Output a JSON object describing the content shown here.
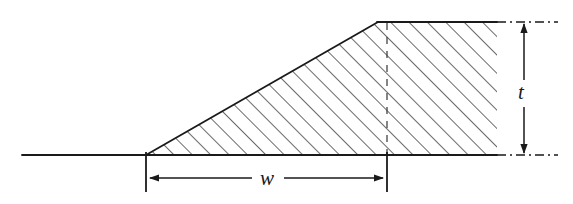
{
  "figure": {
    "type": "technical-line-drawing",
    "background_color": "#ffffff",
    "line_color": "#1a1a1a",
    "hatch_color": "#2b2b2b"
  },
  "labels": {
    "width_label": "w",
    "thickness_label": "t"
  },
  "geometry": {
    "ground_line": {
      "name": "ground-reference-line",
      "x1": 22,
      "y1": 155,
      "x2": 497,
      "y2": 155
    },
    "section_outline": {
      "name": "hatched-trapezoid",
      "points": "146,155 378,22 497,22 497,155",
      "fill_pattern": "diagonal-hatch-45deg"
    },
    "slope_edge": {
      "x1": 146,
      "y1": 155,
      "x2": 378,
      "y2": 22
    },
    "top_edge": {
      "x1": 378,
      "y1": 22,
      "x2": 497,
      "y2": 22
    },
    "interior_dashed_line": {
      "x": 387,
      "y1": 22,
      "y2": 155
    }
  },
  "dimensions": {
    "width": {
      "name": "w-dimension",
      "label": "w",
      "extension_left_x": 146,
      "extension_right_x": 387,
      "extension_top_y": 152,
      "extension_bottom_y": 192,
      "arrow_y": 178,
      "arrow_left_x": 150,
      "arrow_right_x": 383,
      "label_x": 267,
      "label_y": 185
    },
    "thickness": {
      "name": "t-dimension",
      "label": "t",
      "arrow_x": 524,
      "arrow_top_y": 24,
      "arrow_bottom_y": 153,
      "extension_top_y": 22,
      "extension_bottom_y": 155,
      "extension_x1": 497,
      "extension_x2": 558,
      "label_x": 521,
      "label_y": 99,
      "line_style": "dash-dot"
    }
  },
  "hatching": {
    "angle_degrees": 45,
    "direction": "up-to-the-right",
    "spacing_px": 13,
    "stroke_width": 1.4
  }
}
